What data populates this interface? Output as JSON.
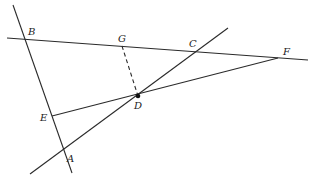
{
  "diagram": {
    "type": "geometry",
    "stroke_color": "#2a2a2a",
    "points": {
      "A": {
        "label": "A",
        "x": 64,
        "y": 153,
        "lx": 67,
        "ly": 162
      },
      "B": {
        "label": "B",
        "x": 25,
        "y": 39,
        "lx": 28,
        "ly": 35
      },
      "C": {
        "label": "C",
        "x": 196,
        "y": 51,
        "lx": 189,
        "ly": 47
      },
      "D": {
        "label": "D",
        "x": 138,
        "y": 96,
        "lx": 134,
        "ly": 109
      },
      "E": {
        "label": "E",
        "x": 52,
        "y": 116,
        "lx": 40,
        "ly": 121
      },
      "F": {
        "label": "F",
        "x": 278,
        "y": 58,
        "lx": 283,
        "ly": 55
      },
      "G": {
        "label": "G",
        "x": 122,
        "y": 46,
        "lx": 118,
        "ly": 42
      }
    },
    "lines": [
      {
        "name": "line-BA",
        "x1": 13,
        "y1": 5,
        "x2": 72,
        "y2": 173,
        "style": "solid"
      },
      {
        "name": "line-BF",
        "x1": 7,
        "y1": 38,
        "x2": 308,
        "y2": 60,
        "style": "solid"
      },
      {
        "name": "line-AC",
        "x1": 30,
        "y1": 174,
        "x2": 228,
        "y2": 28,
        "style": "solid"
      },
      {
        "name": "segment-EF",
        "x1": 52,
        "y1": 116,
        "x2": 278,
        "y2": 58,
        "style": "solid"
      },
      {
        "name": "segment-GD",
        "x1": 122,
        "y1": 46,
        "x2": 138,
        "y2": 96,
        "style": "dashed"
      }
    ],
    "marked_point": "D"
  }
}
